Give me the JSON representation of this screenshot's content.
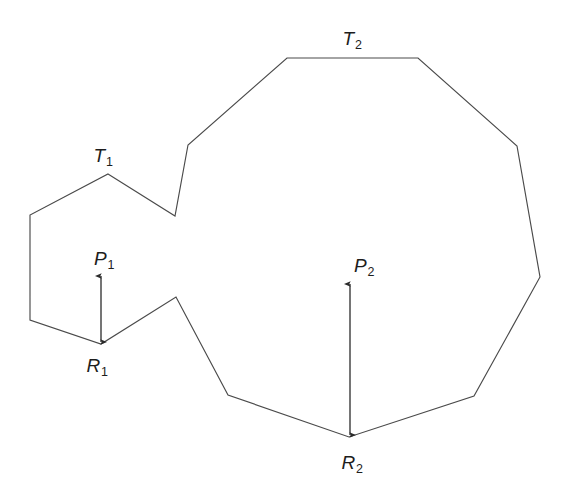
{
  "figure": {
    "width": 565,
    "height": 502,
    "background_color": "#ffffff",
    "outline_color": "#4a4a4a",
    "measure_color": "#2b2b2b"
  },
  "labels": {
    "t1": {
      "base": "T",
      "sub": "1",
      "x": 103,
      "y": 155
    },
    "t2": {
      "base": "T",
      "sub": "2",
      "x": 352,
      "y": 38
    },
    "p1": {
      "base": "P",
      "sub": "1",
      "x": 104,
      "y": 258
    },
    "p2": {
      "base": "P",
      "sub": "2",
      "x": 364,
      "y": 265
    },
    "r1": {
      "base": "R",
      "sub": "1",
      "x": 97,
      "y": 365
    },
    "r2": {
      "base": "R",
      "sub": "2",
      "x": 352,
      "y": 462
    }
  },
  "chart_data": {
    "type": "diagram",
    "title": "",
    "polygon": {
      "closed": true,
      "vertices": [
        [
          108,
          174
        ],
        [
          175,
          216
        ],
        [
          188,
          145
        ],
        [
          287,
          58
        ],
        [
          418,
          58
        ],
        [
          517,
          146
        ],
        [
          540,
          277
        ],
        [
          474,
          396
        ],
        [
          349,
          437
        ],
        [
          228,
          395
        ],
        [
          176,
          297
        ],
        [
          101,
          344
        ],
        [
          30,
          320
        ],
        [
          30,
          215
        ]
      ],
      "named_points": {
        "T1": [
          108,
          174
        ],
        "T2_left": [
          287,
          58
        ],
        "T2_right": [
          418,
          58
        ],
        "R1": [
          101,
          344
        ],
        "R2": [
          349,
          437
        ],
        "notch_bottom": [
          175,
          216
        ],
        "notch_top": [
          188,
          145
        ],
        "saddle_peak": [
          176,
          297
        ]
      }
    },
    "measures": [
      {
        "name": "P1",
        "x": 101,
        "y_top": 274,
        "y_bottom": 344,
        "length": 70,
        "double_headed": true,
        "from_label": "P1",
        "to_label": "R1"
      },
      {
        "name": "P2",
        "x": 350,
        "y_top": 282,
        "y_bottom": 437,
        "length": 155,
        "double_headed": true,
        "from_label": "P2",
        "to_label": "R2"
      }
    ]
  }
}
